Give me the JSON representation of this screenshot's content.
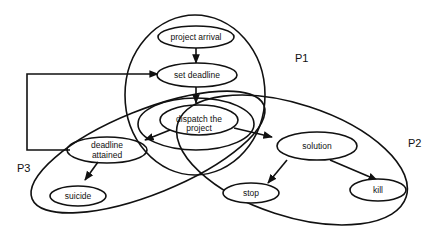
{
  "diagram": {
    "nodes": {
      "project_arrival": "project arrival",
      "set_deadline": "set deadline",
      "dispatch_line1": "dispatch the",
      "dispatch_line2": "project",
      "deadline_attained_line1": "deadline",
      "deadline_attained_line2": "attained",
      "suicide": "suicide",
      "solution": "solution",
      "stop": "stop",
      "kill": "kill"
    },
    "regions": {
      "p1": "P1",
      "p2": "P2",
      "p3": "P3"
    },
    "edges": [
      {
        "from": "project arrival",
        "to": "set deadline"
      },
      {
        "from": "set deadline",
        "to": "dispatch the project"
      },
      {
        "from": "dispatch the project",
        "to": "deadline attained"
      },
      {
        "from": "dispatch the project",
        "to": "solution"
      },
      {
        "from": "deadline attained",
        "to": "suicide"
      },
      {
        "from": "deadline attained",
        "to": "set deadline",
        "style": "loop"
      },
      {
        "from": "solution",
        "to": "stop"
      },
      {
        "from": "solution",
        "to": "kill"
      }
    ]
  }
}
